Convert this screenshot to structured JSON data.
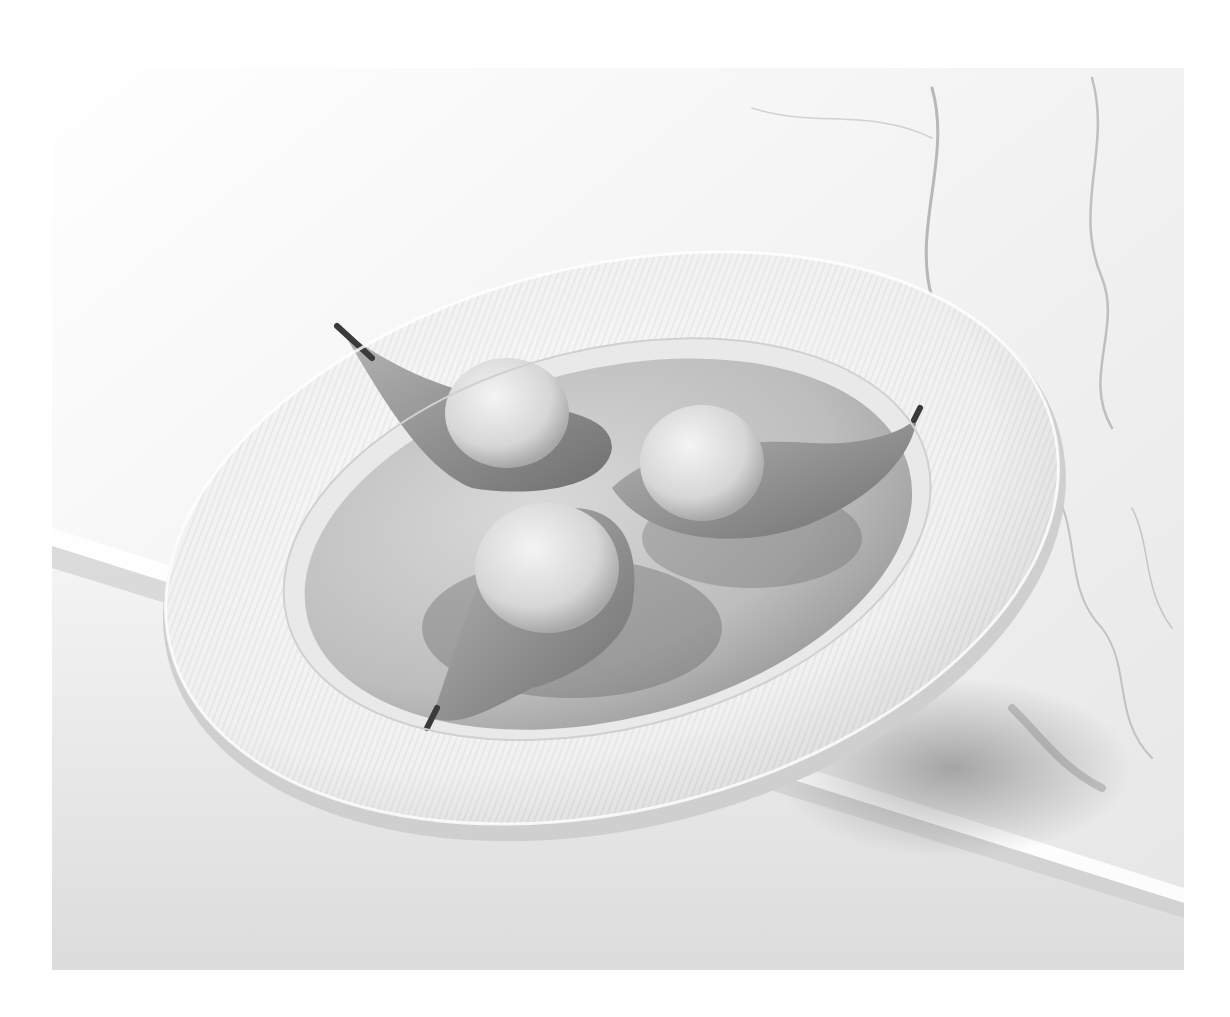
{
  "image": {
    "subject": "Poached pear halves topped with ice cream scoops in a white fluted bowl on marble",
    "style": "black-and-white photograph",
    "elements": [
      "marble-surface",
      "marble-slab-edge",
      "fluted-bowl",
      "poaching-liquid",
      "pear-half-left",
      "pear-half-right",
      "pear-half-front",
      "ice-cream-scoop-left",
      "ice-cream-scoop-right",
      "ice-cream-scoop-front"
    ],
    "colors": {
      "background": "#ffffff",
      "marble": "#eeeeee",
      "vein": "#9a9a9a",
      "bowl": "#f4f4f4",
      "liquid": "#b8b8b8",
      "pear": "#8e8e8e",
      "ice_cream": "#e2e2e2",
      "shadow": "#5a5a5a"
    }
  }
}
